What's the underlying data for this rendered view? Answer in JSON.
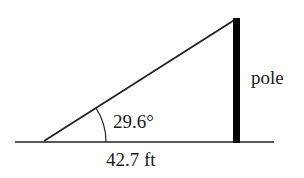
{
  "diagram": {
    "type": "right-triangle",
    "labels": {
      "angle": "29.6°",
      "base": "42.7 ft",
      "pole": "pole"
    },
    "colors": {
      "stroke": "#222222",
      "pole": "#000000",
      "background": "#ffffff"
    }
  }
}
